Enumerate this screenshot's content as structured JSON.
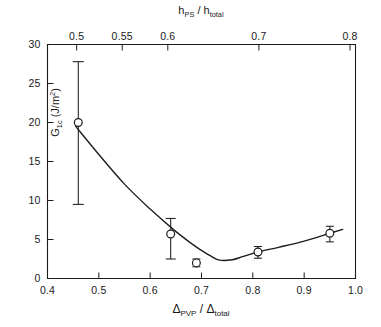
{
  "figure": {
    "background": "#ffffff",
    "ink_color": "#1c1c1c"
  },
  "axes": {
    "bottom": {
      "title_main_1": "Δ",
      "title_sub_1": "PVP",
      "title_slash": " / ",
      "title_main_2": "Δ",
      "title_sub_2": "total",
      "tick_labels": [
        "0.4",
        "0.5",
        "0.6",
        "0.7",
        "0.8",
        "0.9",
        "1.0"
      ],
      "tick_values": [
        0.4,
        0.5,
        0.6,
        0.7,
        0.8,
        0.9,
        1.0
      ],
      "range": [
        0.4,
        1.0
      ]
    },
    "top": {
      "title_main_1": "h",
      "title_sub_1": "PS",
      "title_slash": " / ",
      "title_main_2": "h",
      "title_sub_2": "total",
      "tick_labels": [
        "0.5",
        "0.55",
        "0.6",
        "0.7",
        "0.8"
      ],
      "tick_values": [
        0.5,
        0.55,
        0.6,
        0.7,
        0.8
      ],
      "range": [
        0.468,
        0.806
      ]
    },
    "left": {
      "title_main": "G",
      "title_sub": "1c",
      "title_unit_open": " (J/m",
      "title_unit_sup": "2",
      "title_unit_close": ")",
      "tick_labels": [
        "0",
        "5",
        "10",
        "15",
        "20",
        "25",
        "30"
      ],
      "tick_values": [
        0,
        5,
        10,
        15,
        20,
        25,
        30
      ],
      "range": [
        0,
        30
      ]
    }
  },
  "chart_data": {
    "type": "scatter",
    "title": "",
    "subtitle": "",
    "xlabel": "Δ_PVP / Δ_total",
    "ylabel": "G_1c (J/m^2)",
    "xlim": [
      0.4,
      1.0
    ],
    "ylim": [
      0,
      30
    ],
    "grid": false,
    "legend": "none",
    "secondary_xaxis": {
      "label": "h_PS / h_total",
      "ticks": [
        0.5,
        0.55,
        0.6,
        0.7,
        0.8
      ],
      "lim": [
        0.468,
        0.806
      ]
    },
    "series": [
      {
        "name": "G_1c vs Δ_PVP/Δ_total",
        "marker": "open-circle",
        "has_error_bars": true,
        "connector": "smooth-curve",
        "points": [
          {
            "x": 0.46,
            "y": 20.0,
            "yerr_low": 10.5,
            "yerr_high": 7.8,
            "y_low": 9.5,
            "y_high": 27.8
          },
          {
            "x": 0.64,
            "y": 5.7,
            "yerr_low": 3.2,
            "yerr_high": 2.0,
            "y_low": 2.5,
            "y_high": 7.7
          },
          {
            "x": 0.69,
            "y": 2.0,
            "yerr_low": 0.5,
            "yerr_high": 0.5,
            "y_low": 1.5,
            "y_high": 2.5
          },
          {
            "x": 0.81,
            "y": 3.4,
            "yerr_low": 0.8,
            "yerr_high": 0.7,
            "y_low": 2.6,
            "y_high": 4.1
          },
          {
            "x": 0.95,
            "y": 5.8,
            "yerr_low": 1.1,
            "yerr_high": 0.9,
            "y_low": 4.7,
            "y_high": 6.7
          }
        ]
      }
    ],
    "fitted_curve": {
      "description": "smooth interpolating curve through the data, minimum near x=0.735, y=2.3",
      "minimum": {
        "x": 0.735,
        "y": 2.3
      },
      "path_points": [
        {
          "x": 0.455,
          "y": 19.5
        },
        {
          "x": 0.5,
          "y": 15.9
        },
        {
          "x": 0.55,
          "y": 12.1
        },
        {
          "x": 0.6,
          "y": 8.9
        },
        {
          "x": 0.645,
          "y": 6.3
        },
        {
          "x": 0.68,
          "y": 4.5
        },
        {
          "x": 0.7,
          "y": 3.6
        },
        {
          "x": 0.72,
          "y": 2.8
        },
        {
          "x": 0.735,
          "y": 2.35
        },
        {
          "x": 0.76,
          "y": 2.4
        },
        {
          "x": 0.78,
          "y": 2.8
        },
        {
          "x": 0.81,
          "y": 3.4
        },
        {
          "x": 0.85,
          "y": 4.0
        },
        {
          "x": 0.9,
          "y": 4.8
        },
        {
          "x": 0.95,
          "y": 5.8
        },
        {
          "x": 0.975,
          "y": 6.3
        }
      ]
    }
  }
}
